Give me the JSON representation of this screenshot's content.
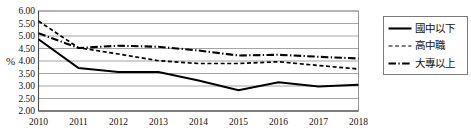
{
  "axis": {
    "unit_label": "%"
  },
  "legend": {
    "items": [
      {
        "label": "國中以下",
        "style": "solid",
        "color": "#000000"
      },
      {
        "label": "高中職",
        "style": "dashed",
        "color": "#555555"
      },
      {
        "label": "大專以上",
        "style": "dash-dot",
        "color": "#000000"
      }
    ]
  },
  "chart_data": {
    "type": "line",
    "title": "",
    "xlabel": "",
    "ylabel": "%",
    "categories": [
      "2010",
      "2011",
      "2012",
      "2013",
      "2014",
      "2015",
      "2016",
      "2017",
      "2018"
    ],
    "x": [
      2010,
      2011,
      2012,
      2013,
      2014,
      2015,
      2016,
      2017,
      2018
    ],
    "ylim": [
      2.0,
      6.0
    ],
    "ytick_labels": [
      "2.00",
      "2.50",
      "3.00",
      "3.50",
      "4.00",
      "4.50",
      "5.00",
      "5.50",
      "6.00"
    ],
    "ytick_values": [
      2.0,
      2.5,
      3.0,
      3.5,
      4.0,
      4.5,
      5.0,
      5.5,
      6.0
    ],
    "grid": true,
    "legend_position": "right",
    "series": [
      {
        "name": "國中以下",
        "style": "solid",
        "color": "#000000",
        "values": [
          4.87,
          3.72,
          3.56,
          3.56,
          3.22,
          2.83,
          3.15,
          2.98,
          3.05
        ]
      },
      {
        "name": "高中職",
        "style": "dashed",
        "color": "#555555",
        "values": [
          5.6,
          4.53,
          4.28,
          4.01,
          3.9,
          3.9,
          3.97,
          3.82,
          3.68
        ]
      },
      {
        "name": "大專以上",
        "style": "dash-dot",
        "color": "#000000",
        "values": [
          5.11,
          4.52,
          4.61,
          4.57,
          4.42,
          4.22,
          4.25,
          4.17,
          4.1
        ]
      }
    ]
  }
}
